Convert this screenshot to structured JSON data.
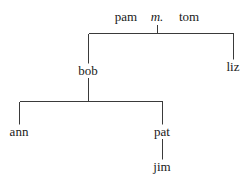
{
  "diagram": {
    "type": "family-tree",
    "width": 247,
    "height": 184,
    "background_color": "#ffffff",
    "line_color": "#3a3a3a",
    "text_color": "#1a1a1a",
    "line_width": 1,
    "font_size": 13,
    "nodes": [
      {
        "id": "pam",
        "label": "pam",
        "x": 126,
        "y": 16,
        "style": "normal"
      },
      {
        "id": "m",
        "label": "m.",
        "x": 157,
        "y": 16,
        "style": "italic"
      },
      {
        "id": "tom",
        "label": "tom",
        "x": 189,
        "y": 16,
        "style": "normal"
      },
      {
        "id": "bob",
        "label": "bob",
        "x": 88,
        "y": 70,
        "style": "normal"
      },
      {
        "id": "liz",
        "label": "liz",
        "x": 233,
        "y": 66,
        "style": "normal"
      },
      {
        "id": "ann",
        "label": "ann",
        "x": 19,
        "y": 131,
        "style": "normal"
      },
      {
        "id": "pat",
        "label": "pat",
        "x": 162,
        "y": 131,
        "style": "normal"
      },
      {
        "id": "jim",
        "label": "jim",
        "x": 162,
        "y": 166,
        "style": "normal"
      }
    ],
    "edges": [
      {
        "id": "marriage-stub",
        "from": "m",
        "to": "sibling-bar-1",
        "points": "157,24 157,33"
      },
      {
        "id": "sibling-bar-1",
        "from": "m",
        "to": "bob-liz",
        "points": "88,33 233,33"
      },
      {
        "id": "bar1-to-bob",
        "from": "m",
        "to": "bob",
        "points": "88,33 88,63"
      },
      {
        "id": "bar1-to-liz",
        "from": "m",
        "to": "liz",
        "points": "233,33 233,59"
      },
      {
        "id": "bob-down",
        "from": "bob",
        "to": "sibling-bar-2",
        "points": "88,77 88,101"
      },
      {
        "id": "sibling-bar-2",
        "from": "bob",
        "to": "ann-pat",
        "points": "19,101 162,101"
      },
      {
        "id": "bar2-to-ann",
        "from": "bob",
        "to": "ann",
        "points": "19,101 19,124"
      },
      {
        "id": "bar2-to-pat",
        "from": "bob",
        "to": "pat",
        "points": "162,101 162,124"
      },
      {
        "id": "pat-to-jim",
        "from": "pat",
        "to": "jim",
        "points": "162,138 162,159"
      }
    ]
  }
}
